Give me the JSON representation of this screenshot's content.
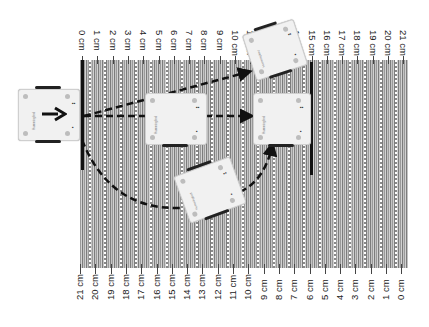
{
  "diagram": {
    "title": "",
    "top_ruler": {
      "labels": [
        "0 cm",
        "1 cm",
        "2 cm",
        "3 cm",
        "4 cm",
        "5 cm",
        "6 cm",
        "7 cm",
        "8 cm",
        "9 cm",
        "10 cm",
        "11 cm",
        "12 cm",
        "13 cm",
        "14 cm",
        "15 cm",
        "16 cm",
        "17 cm",
        "18 cm",
        "19 cm",
        "20 cm",
        "21 cm"
      ]
    },
    "bottom_ruler": {
      "labels": [
        "21 cm",
        "20 cm",
        "19 cm",
        "18 cm",
        "17 cm",
        "16 cm",
        "15 cm",
        "14 cm",
        "13 cm",
        "12 cm",
        "11 cm",
        "10 cm",
        "9 cm",
        "8 cm",
        "7 cm",
        "6 cm",
        "5 cm",
        "4 cm",
        "3 cm",
        "2 cm",
        "1 cm",
        "0 cm"
      ]
    },
    "robots": [
      {
        "id": "start",
        "brand": "Hummingbird",
        "state": "start"
      },
      {
        "id": "mid-left",
        "brand": "Hummingbird",
        "state": "intermediate"
      },
      {
        "id": "target-straight",
        "brand": "Hummingbird",
        "state": "end"
      },
      {
        "id": "target-diagonal",
        "brand": "Hummingbird",
        "state": "end-rotated"
      },
      {
        "id": "arc-midpoint",
        "brand": "Hummingbird",
        "state": "arc-midpoint"
      }
    ],
    "paths": [
      {
        "name": "straight-path",
        "style": "dashed",
        "from": "start",
        "to": "target-straight"
      },
      {
        "name": "diagonal-path",
        "style": "dashed",
        "from": "start",
        "to": "target-diagonal"
      },
      {
        "name": "arc-path",
        "style": "dashed",
        "from": "start",
        "to": "target-straight",
        "via": "arc-midpoint"
      }
    ],
    "colors": {
      "background": "#ffffff",
      "stripe_dark": "#7c7c7c",
      "stripe_light": "#d2d2d2",
      "line": "#111111",
      "robot_body": "#f1f1f1"
    }
  }
}
